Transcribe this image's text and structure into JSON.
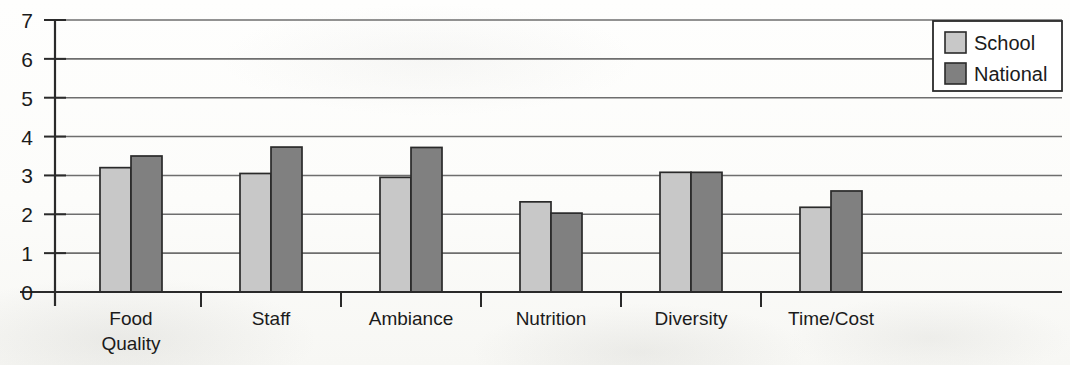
{
  "chart_data": {
    "type": "bar",
    "title": "",
    "subtitle": "",
    "xlabel": "",
    "ylabel": "",
    "categories": [
      "Food Quality",
      "Staff",
      "Ambiance",
      "Nutrition",
      "Diversity",
      "Time/Cost"
    ],
    "category_label_lines": [
      [
        "Food",
        "Quality"
      ],
      [
        "Staff"
      ],
      [
        "Ambiance"
      ],
      [
        "Nutrition"
      ],
      [
        "Diversity"
      ],
      [
        "Time/Cost"
      ]
    ],
    "series": [
      {
        "name": "School",
        "color": "#c8c8c8",
        "values": [
          3.2,
          3.05,
          2.95,
          2.32,
          3.08,
          2.18
        ]
      },
      {
        "name": "National",
        "color": "#808080",
        "values": [
          3.5,
          3.73,
          3.72,
          2.03,
          3.08,
          2.6
        ]
      }
    ],
    "ylim": [
      0,
      7
    ],
    "ytick_labels": [
      "0",
      "1",
      "2",
      "3",
      "4",
      "5",
      "6",
      "7"
    ],
    "ytick_values": [
      0,
      1,
      2,
      3,
      4,
      5,
      6,
      7
    ],
    "grid": true,
    "grid_axis": "y",
    "legend_position": "top-right",
    "bar_outline_color": "#2a2a2a",
    "axis_color": "#2a2a2a",
    "grid_color": "#6e6e6e"
  },
  "legend": {
    "entries": [
      {
        "label": "School",
        "swatch": "#c8c8c8"
      },
      {
        "label": "National",
        "swatch": "#808080"
      }
    ]
  },
  "axis": {
    "y_ticks": [
      "7",
      "6",
      "5",
      "4",
      "3",
      "2",
      "1",
      "0"
    ]
  }
}
